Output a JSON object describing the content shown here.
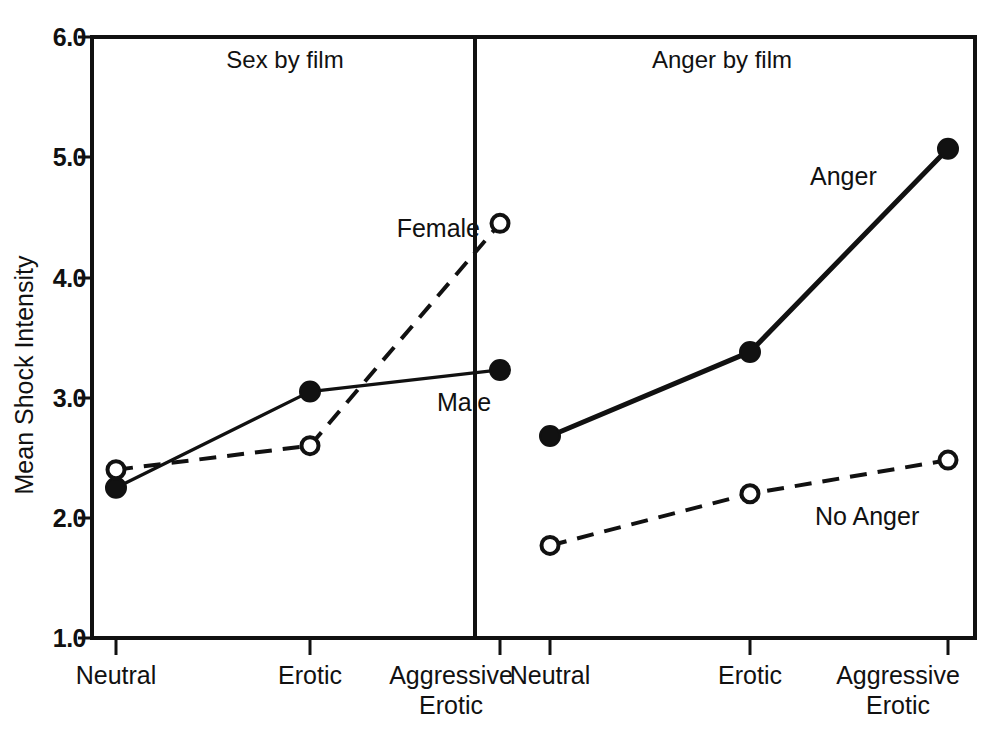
{
  "chart_data": {
    "type": "line",
    "title": "",
    "xlabel": "",
    "ylabel": "Mean Shock Intensity",
    "ylim": [
      1.0,
      6.0
    ],
    "ytick_labels": [
      "6.0",
      "5.0",
      "4.0",
      "3.0",
      "2.0",
      "1.0"
    ],
    "ytick_values": [
      6.0,
      5.0,
      4.0,
      3.0,
      2.0,
      1.0
    ],
    "categories": [
      "Neutral",
      "Erotic",
      "Aggressive Erotic"
    ],
    "category_lines": [
      [
        "Neutral"
      ],
      [
        "Erotic"
      ],
      [
        "Aggressive",
        "Erotic"
      ]
    ],
    "grid": false,
    "legend_position": "inline-annotation",
    "panels": [
      {
        "name": "sex-by-film",
        "title": "Sex by film",
        "series": [
          {
            "name": "Male",
            "label": "Male",
            "marker": "filled-circle",
            "line": "solid",
            "values": [
              2.25,
              3.05,
              3.23
            ]
          },
          {
            "name": "Female",
            "label": "Female",
            "marker": "open-circle",
            "line": "dashed",
            "values": [
              2.4,
              2.6,
              4.45
            ]
          }
        ]
      },
      {
        "name": "anger-by-film",
        "title": "Anger by film",
        "series": [
          {
            "name": "Anger",
            "label": "Anger",
            "marker": "filled-circle",
            "line": "solid",
            "values": [
              2.68,
              3.38,
              5.07
            ]
          },
          {
            "name": "No Anger",
            "label": "No Anger",
            "marker": "open-circle",
            "line": "dashed",
            "values": [
              1.77,
              2.2,
              2.48
            ]
          }
        ]
      }
    ],
    "colors": {
      "line": "#111111",
      "background": "#ffffff",
      "marker_fill_filled": "#111111",
      "marker_fill_open": "#ffffff"
    }
  }
}
